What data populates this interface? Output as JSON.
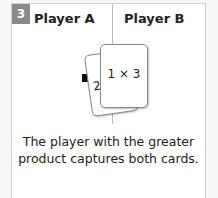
{
  "step_badge": "3",
  "columns": {
    "player_a": "Player A",
    "player_b": "Player B"
  },
  "cards": {
    "back_card_partial_text": "2",
    "front_card_text": "1 × 3"
  },
  "caption_lines": [
    "The player with the greater",
    "product captures both cards."
  ],
  "colors": {
    "badge": "#8a8a8a",
    "border": "#cfcfcf",
    "arrow": "#111111"
  }
}
